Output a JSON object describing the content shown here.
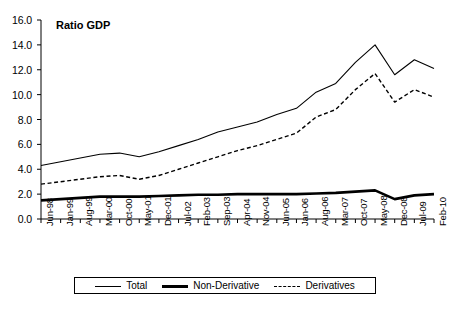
{
  "chart_data": {
    "type": "line",
    "title": "Ratio GDP",
    "xlabel": "",
    "ylabel": "",
    "ylim": [
      0.0,
      16.0
    ],
    "ytick_step": 2.0,
    "grid": false,
    "legend_position": "bottom",
    "yticks": [
      "0.0",
      "2.0",
      "4.0",
      "6.0",
      "8.0",
      "10.0",
      "12.0",
      "14.0",
      "16.0"
    ],
    "categories": [
      "Jun-98",
      "Jan-99",
      "Aug-99",
      "Mar-00",
      "Oct-00",
      "May-01",
      "Dec-01",
      "Jul-02",
      "Feb-03",
      "Sep-03",
      "Apr-04",
      "Nov-04",
      "Jun-05",
      "Jan-06",
      "Aug-06",
      "Mar-07",
      "Oct-07",
      "May-08",
      "Dec-08",
      "Jul-09",
      "Feb-10"
    ],
    "series": [
      {
        "name": "Total",
        "style": "thin-solid",
        "color": "#000000",
        "values": [
          4.3,
          4.6,
          4.9,
          5.2,
          5.3,
          5.0,
          5.4,
          5.9,
          6.4,
          7.0,
          7.4,
          7.8,
          8.4,
          8.9,
          10.2,
          10.9,
          12.6,
          14.0,
          11.6,
          12.8,
          12.1
        ]
      },
      {
        "name": "Non-Derivative",
        "style": "thick-solid",
        "color": "#000000",
        "values": [
          1.5,
          1.6,
          1.7,
          1.8,
          1.8,
          1.8,
          1.85,
          1.9,
          1.95,
          1.95,
          2.0,
          2.0,
          2.0,
          2.0,
          2.05,
          2.1,
          2.2,
          2.3,
          1.6,
          1.9,
          2.0
        ]
      },
      {
        "name": "Derivatives",
        "style": "dashed",
        "color": "#000000",
        "values": [
          2.8,
          3.0,
          3.2,
          3.4,
          3.5,
          3.2,
          3.5,
          4.0,
          4.5,
          5.0,
          5.5,
          5.9,
          6.4,
          6.9,
          8.2,
          8.8,
          10.4,
          11.7,
          9.4,
          10.4,
          9.8
        ]
      }
    ]
  },
  "legend": {
    "items": [
      {
        "label": "Total",
        "swatch": "thin-line-swatch"
      },
      {
        "label": "Non-Derivative",
        "swatch": "thick-line-swatch"
      },
      {
        "label": "Derivatives",
        "swatch": "dashed-line-swatch"
      }
    ]
  }
}
